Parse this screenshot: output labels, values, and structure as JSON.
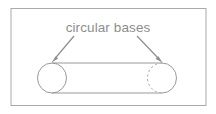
{
  "figure": {
    "name": "cylinder-with-circular-bases",
    "background_color": "#ffffff",
    "frame": {
      "name": "figure-border",
      "stroke_color": "#a9a9a9",
      "x": 11,
      "y": 8.5,
      "width": 195,
      "height": 97
    },
    "annotation": {
      "label": "circular bases",
      "text_color": "#8d8d8d",
      "font_size": 13.5,
      "text_x": 108,
      "text_baseline_y": 32
    },
    "leader_lines": [
      {
        "name": "leader-line-left",
        "from_x": 74,
        "from_y": 36,
        "to_x": 52,
        "to_y": 62,
        "stroke_color": "#8d8d8d",
        "arrowhead": "at-end"
      },
      {
        "name": "leader-line-right",
        "from_x": 137,
        "from_y": 36,
        "to_x": 162,
        "to_y": 62,
        "stroke_color": "#8d8d8d",
        "arrowhead": "at-end"
      }
    ],
    "cylinder": {
      "name": "cylinder-shape",
      "stroke_color": "#999999",
      "left_base": {
        "name": "left-circular-base",
        "center_x": 52,
        "center_y": 78,
        "radius_x": 14.5,
        "radius_y": 15,
        "style": "solid"
      },
      "right_base": {
        "name": "right-circular-base",
        "center_x": 162,
        "center_y": 78,
        "radius_x": 14.5,
        "radius_y": 15,
        "front_arc_style": "solid",
        "hidden_arc_style": "dashed"
      },
      "body_top_line": {
        "name": "cylinder-top-edge",
        "x1": 52,
        "y1": 63,
        "x2": 162,
        "y2": 63
      },
      "body_bottom_line": {
        "name": "cylinder-bottom-edge",
        "x1": 52,
        "y1": 93,
        "x2": 162,
        "y2": 93
      }
    }
  }
}
